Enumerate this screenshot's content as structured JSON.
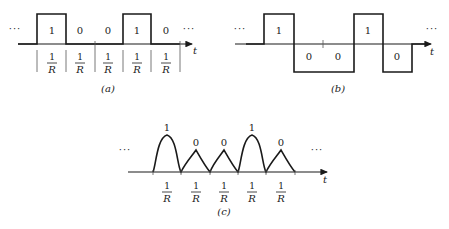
{
  "figure": {
    "bit_sequence": [
      "1",
      "0",
      "0",
      "1",
      "0"
    ],
    "ellipsis": "···",
    "time_label": "t",
    "interval_numerator": "1",
    "interval_denominator": "R"
  },
  "panels": [
    {
      "id": "a",
      "caption": "(a)",
      "type": "unipolar NRZ (on-off) pulses",
      "bits": [
        {
          "label": "1",
          "level": "high"
        },
        {
          "label": "0",
          "level": "zero"
        },
        {
          "label": "0",
          "level": "zero"
        },
        {
          "label": "1",
          "level": "high"
        },
        {
          "label": "0",
          "level": "zero"
        }
      ],
      "intervals": [
        "1/R",
        "1/R",
        "1/R",
        "1/R",
        "1/R"
      ]
    },
    {
      "id": "b",
      "caption": "(b)",
      "type": "polar NRZ pulses",
      "bits": [
        {
          "label": "1",
          "level": "positive"
        },
        {
          "label": "0",
          "level": "negative"
        },
        {
          "label": "0",
          "level": "negative"
        },
        {
          "label": "1",
          "level": "positive"
        },
        {
          "label": "0",
          "level": "negative"
        }
      ]
    },
    {
      "id": "c",
      "caption": "(c)",
      "type": "shaped pulses (large rounded for 1, small triangular for 0)",
      "bits": [
        {
          "label": "1",
          "shape": "large-rounded"
        },
        {
          "label": "0",
          "shape": "small-triangular"
        },
        {
          "label": "0",
          "shape": "small-triangular"
        },
        {
          "label": "1",
          "shape": "large-rounded"
        },
        {
          "label": "0",
          "shape": "small-triangular"
        }
      ],
      "intervals": [
        "1/R",
        "1/R",
        "1/R",
        "1/R",
        "1/R"
      ]
    }
  ],
  "colors": {
    "ink": "#1a1a1a",
    "background": "#ffffff"
  }
}
